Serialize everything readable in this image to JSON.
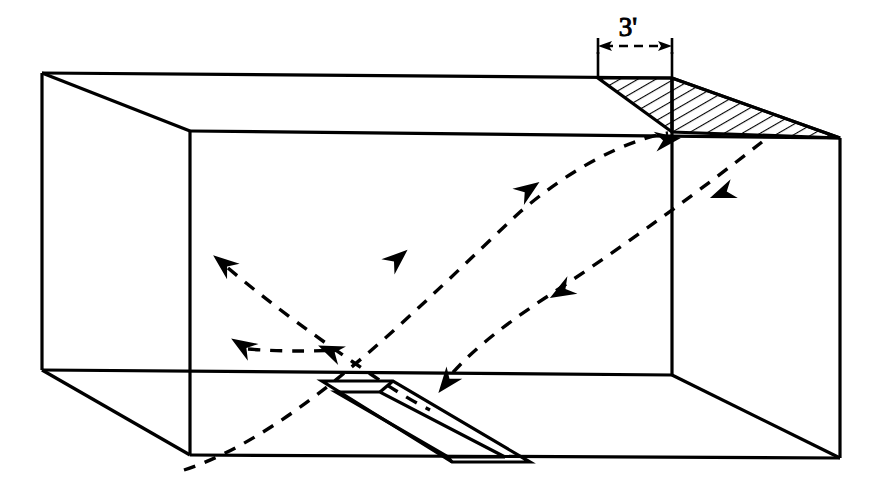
{
  "figure": {
    "kind": "isometric-room-airflow-diagram",
    "background_color": "#ffffff",
    "line_color": "#000000",
    "dashed_color": "#000000",
    "hatch_color": "#000000"
  },
  "annotations": {
    "dimension_label": "3'",
    "dimension_label_x": 628,
    "dimension_label_y": 36
  },
  "dimension_line": {
    "left_tick_x": 598,
    "right_tick_x": 672,
    "line_y": 46,
    "extension_top_y": 52,
    "extension_bottom_y": 78
  },
  "room_box": {
    "back_top_left": [
      42,
      73
    ],
    "back_top_right": [
      672,
      78
    ],
    "back_bottom_left": [
      42,
      370
    ],
    "back_bottom_right": [
      672,
      375
    ],
    "front_top_left": [
      190,
      131
    ],
    "front_top_right": [
      840,
      138
    ],
    "front_bottom_left": [
      190,
      455
    ],
    "front_bottom_right": [
      840,
      458
    ]
  },
  "soffit_wedge": {
    "description": "hatched sloping soffit at top right",
    "points": "598,78 672,78 840,138 672,132",
    "hatch_spacing": 9,
    "hatch_angle_deg": 60
  },
  "floor_slot": {
    "description": "linear slot diffuser set in floor",
    "outer": "322,381 393,381 530,462 452,462",
    "inner": "336,392 380,392 505,457 448,457",
    "cap_top": "322,381 393,381 388,392 336,392",
    "cap_bottom": "452,462 530,462 505,457 448,457"
  },
  "airflow_curves": [
    {
      "name": "supply-jet-upper",
      "direction": "up-right",
      "path": "M 184,470 C 290,430 420,300 530,205 C 600,150 650,140 672,134"
    },
    {
      "name": "return-path-right",
      "direction": "down-left",
      "path": "M 760,140 C 700,190 620,250 540,300 C 490,335 460,360 444,382"
    },
    {
      "name": "cross-jet-left-a",
      "direction": "up-left",
      "path": "M 330,360 C 300,330 260,295 224,266"
    },
    {
      "name": "cross-jet-left-b",
      "direction": "down-right",
      "path": "M 224,266 C 260,295 300,330 336,358"
    },
    {
      "name": "cross-jet-left-c",
      "direction": "up-left",
      "path": "M 330,350 C 300,345 275,347 246,347"
    }
  ],
  "arrow_markers": [
    {
      "name": "arrow-supply-mid-low",
      "x": 397,
      "y": 259,
      "angle": -40
    },
    {
      "name": "arrow-supply-mid-high",
      "x": 528,
      "y": 190,
      "angle": -33
    },
    {
      "name": "arrow-supply-inlet",
      "x": 668,
      "y": 140,
      "angle": -12
    },
    {
      "name": "arrow-return-top",
      "x": 722,
      "y": 192,
      "angle": 160
    },
    {
      "name": "arrow-return-mid",
      "x": 562,
      "y": 291,
      "angle": 150
    },
    {
      "name": "arrow-return-floor",
      "x": 447,
      "y": 382,
      "angle": 125
    },
    {
      "name": "arrow-cross-upleft",
      "x": 224,
      "y": 264,
      "angle": 215
    },
    {
      "name": "arrow-cross-lowleft",
      "x": 243,
      "y": 346,
      "angle": 215
    },
    {
      "name": "arrow-cross-lowright",
      "x": 331,
      "y": 351,
      "angle": 205
    }
  ]
}
